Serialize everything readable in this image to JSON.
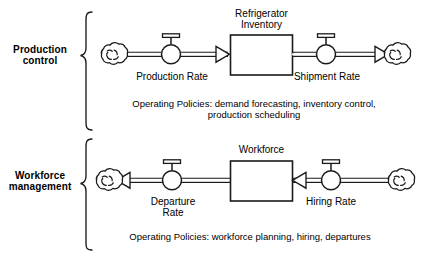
{
  "diagram": {
    "type": "stock-and-flow",
    "title": "",
    "background_color": "#ffffff",
    "line_color": "#1a1a1a"
  },
  "sections": [
    {
      "id": "production-control",
      "label": "Production\ncontrol",
      "label_line1": "Production",
      "label_line2": "control",
      "stock": {
        "name": "Refrigerator Inventory",
        "line1": "Refrigerator",
        "line2": "Inventory"
      },
      "inflow": {
        "name": "Production Rate",
        "source": "cloud",
        "direction": "right"
      },
      "outflow": {
        "name": "Shipment Rate",
        "sink": "cloud",
        "direction": "right"
      },
      "policies": {
        "line1": "Operating Policies: demand forecasting, inventory control,",
        "line2": "production scheduling"
      }
    },
    {
      "id": "workforce-management",
      "label": "Workforce\nmanagement",
      "label_line1": "Workforce",
      "label_line2": "management",
      "stock": {
        "name": "Workforce",
        "line1": "Workforce",
        "line2": ""
      },
      "outflow": {
        "name": "Departure Rate",
        "line1": "Departure",
        "line2": "Rate",
        "sink": "cloud",
        "direction": "left"
      },
      "inflow": {
        "name": "Hiring Rate",
        "line1": "Hiring Rate",
        "line2": "",
        "source": "cloud",
        "direction": "left"
      },
      "policies": {
        "line1": "Operating Policies: workforce planning, hiring, departures",
        "line2": ""
      }
    }
  ],
  "icons": {
    "cloud": "cloud-icon",
    "valve": "valve-icon",
    "brace": "curly-brace-icon",
    "arrow": "flow-arrowhead-icon",
    "stock": "stock-box-icon"
  }
}
